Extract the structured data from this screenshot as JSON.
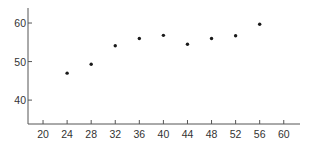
{
  "chart_data": {
    "type": "scatter",
    "title": "",
    "xlabel": "",
    "ylabel": "",
    "xlim": [
      17.5,
      62.7
    ],
    "ylim": [
      33.8,
      63.9
    ],
    "x_ticks": [
      20,
      24,
      28,
      32,
      36,
      40,
      44,
      48,
      52,
      56,
      60
    ],
    "y_ticks": [
      40,
      50,
      60
    ],
    "grid": false,
    "legend": null,
    "series": [
      {
        "name": "points",
        "marker": "dot",
        "color": "#1a1a1a",
        "points": [
          {
            "x": 24,
            "y": 47.0
          },
          {
            "x": 28,
            "y": 49.3
          },
          {
            "x": 32,
            "y": 54.1
          },
          {
            "x": 36,
            "y": 56.0
          },
          {
            "x": 40,
            "y": 56.8
          },
          {
            "x": 44,
            "y": 54.5
          },
          {
            "x": 48,
            "y": 56.0
          },
          {
            "x": 52,
            "y": 56.7
          },
          {
            "x": 56,
            "y": 59.7
          }
        ]
      }
    ]
  },
  "style": {
    "axis_color": "#555555",
    "text_color": "#333333",
    "background": "#ffffff"
  }
}
